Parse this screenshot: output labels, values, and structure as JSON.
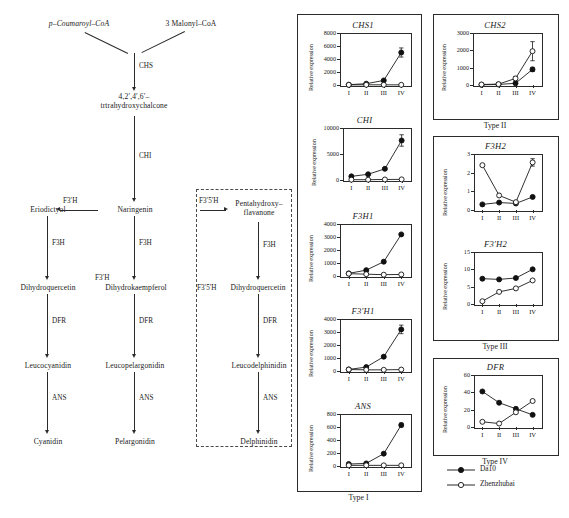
{
  "pathway": {
    "substrates": [
      {
        "id": "p-coumaroyl",
        "label": "p–Coumaroyl–CoA"
      },
      {
        "id": "malonyl",
        "label": "3  Malonyl–CoA"
      }
    ],
    "nodes": [
      {
        "id": "chalcone",
        "line1": "4,2′,4′,6′–",
        "line2": "trtrahydroxychalcone"
      },
      {
        "id": "eriodictyol",
        "line1": "Eriodictyol",
        "line2": ""
      },
      {
        "id": "naringenin",
        "line1": "Naringenin",
        "line2": ""
      },
      {
        "id": "pentahydroxy",
        "line1": "Pentahydroxy–",
        "line2": "flavanone"
      },
      {
        "id": "dihydroquercetin-left",
        "line1": "Dihydroquercetin",
        "line2": ""
      },
      {
        "id": "dihydrokaempferol",
        "line1": "Dihydrokaempferol",
        "line2": ""
      },
      {
        "id": "dihydroquercetin-right",
        "line1": "Dihydroquercetin",
        "line2": ""
      },
      {
        "id": "leucocyanidin",
        "line1": "Leucocyanidin",
        "line2": ""
      },
      {
        "id": "leucopelargonidin",
        "line1": "Leucopelargonidin",
        "line2": ""
      },
      {
        "id": "leucodelphinidin",
        "line1": "Leucodelphinidin",
        "line2": ""
      },
      {
        "id": "cyanidin",
        "line1": "Cyanidin",
        "line2": ""
      },
      {
        "id": "pelargonidin",
        "line1": "Pelargonidin",
        "line2": ""
      },
      {
        "id": "delphinidin",
        "line1": "Delphinidin",
        "line2": ""
      }
    ],
    "enzymes": {
      "chs": "CHS",
      "chi": "CHI",
      "f3ph_a": "F3′H",
      "f3p5ph_a": "F3′5′H",
      "f3h_left": "F3H",
      "f3h_mid": "F3H",
      "f3h_right": "F3H",
      "f3ph_b": "F3′H",
      "f3p5ph_b": "F3′5′H",
      "dfr_left": "DFR",
      "dfr_mid": "DFR",
      "dfr_right": "DFR",
      "ans_left": "ANS",
      "ans_mid": "ANS",
      "ans_right": "ANS"
    }
  },
  "axis": {
    "ylabel": "Relative expression",
    "xticks": [
      "I",
      "II",
      "III",
      "IV"
    ]
  },
  "legend": {
    "items": [
      {
        "name": "Da10",
        "marker": "filled-circle"
      },
      {
        "name": "Zhenzhubai",
        "marker": "open-circle"
      }
    ]
  },
  "groups": [
    {
      "id": "type1",
      "label": "Type I"
    },
    {
      "id": "type2",
      "label": "Type II"
    },
    {
      "id": "type3",
      "label": "Type III"
    },
    {
      "id": "type4",
      "label": "Type IV"
    }
  ],
  "chart_data": [
    {
      "id": "CHS1",
      "type": "line",
      "title": "CHS1",
      "group": "Type I",
      "xlabel": "",
      "ylabel": "Relative expression",
      "categories": [
        "I",
        "II",
        "III",
        "IV"
      ],
      "ylim": [
        0,
        8000
      ],
      "yticks": [
        0,
        2000,
        4000,
        6000,
        8000
      ],
      "grid": false,
      "legend_position": "external-bottom-right",
      "series": [
        {
          "name": "Da10",
          "marker": "filled-circle",
          "values": [
            50,
            200,
            700,
            5000
          ],
          "errors": [
            0,
            40,
            120,
            700
          ]
        },
        {
          "name": "Zhenzhubai",
          "marker": "open-circle",
          "values": [
            20,
            30,
            30,
            20
          ],
          "errors": [
            0,
            0,
            0,
            0
          ]
        }
      ]
    },
    {
      "id": "CHI",
      "type": "line",
      "title": "CHI",
      "group": "Type I",
      "xlabel": "",
      "ylabel": "Relative expression",
      "categories": [
        "I",
        "II",
        "III",
        "IV"
      ],
      "ylim": [
        0,
        10000
      ],
      "yticks": [
        0,
        5000,
        10000
      ],
      "grid": false,
      "series": [
        {
          "name": "Da10",
          "marker": "filled-circle",
          "values": [
            700,
            1100,
            2150,
            7600
          ],
          "errors": [
            130,
            150,
            200,
            1100
          ]
        },
        {
          "name": "Zhenzhubai",
          "marker": "open-circle",
          "values": [
            60,
            60,
            100,
            120
          ],
          "errors": [
            0,
            0,
            0,
            0
          ]
        }
      ]
    },
    {
      "id": "F3H1",
      "type": "line",
      "title": "F3H1",
      "group": "Type I",
      "xlabel": "",
      "ylabel": "Relative expression",
      "categories": [
        "I",
        "II",
        "III",
        "IV"
      ],
      "ylim": [
        0,
        4000
      ],
      "yticks": [
        0,
        1000,
        2000,
        3000,
        4000
      ],
      "grid": false,
      "series": [
        {
          "name": "Da10",
          "marker": "filled-circle",
          "values": [
            200,
            450,
            1100,
            3200
          ],
          "errors": [
            0,
            60,
            110,
            0
          ]
        },
        {
          "name": "Zhenzhubai",
          "marker": "open-circle",
          "values": [
            180,
            140,
            100,
            120
          ],
          "errors": [
            0,
            0,
            0,
            0
          ]
        }
      ]
    },
    {
      "id": "F3'H1",
      "type": "line",
      "title": "F3′H1",
      "group": "Type I",
      "xlabel": "",
      "ylabel": "Relative expression",
      "categories": [
        "I",
        "II",
        "III",
        "IV"
      ],
      "ylim": [
        0,
        4000
      ],
      "yticks": [
        0,
        1000,
        2000,
        3000,
        4000
      ],
      "grid": false,
      "series": [
        {
          "name": "Da10",
          "marker": "filled-circle",
          "values": [
            120,
            300,
            1100,
            3200
          ],
          "errors": [
            0,
            60,
            110,
            330
          ]
        },
        {
          "name": "Zhenzhubai",
          "marker": "open-circle",
          "values": [
            110,
            90,
            90,
            110
          ],
          "errors": [
            0,
            0,
            0,
            0
          ]
        }
      ]
    },
    {
      "id": "ANS",
      "type": "line",
      "title": "ANS",
      "group": "Type I",
      "xlabel": "",
      "ylabel": "Relative expression",
      "categories": [
        "I",
        "II",
        "III",
        "IV"
      ],
      "ylim": [
        0,
        800
      ],
      "yticks": [
        0,
        200,
        400,
        600,
        800
      ],
      "grid": false,
      "series": [
        {
          "name": "Da10",
          "marker": "filled-circle",
          "values": [
            30,
            40,
            190,
            630
          ],
          "errors": [
            0,
            0,
            20,
            30
          ]
        },
        {
          "name": "Zhenzhubai",
          "marker": "open-circle",
          "values": [
            10,
            10,
            10,
            10
          ],
          "errors": [
            0,
            0,
            0,
            0
          ]
        }
      ]
    },
    {
      "id": "CHS2",
      "type": "line",
      "title": "CHS2",
      "group": "Type II",
      "xlabel": "",
      "ylabel": "Relative expression",
      "categories": [
        "I",
        "II",
        "III",
        "IV"
      ],
      "ylim": [
        0,
        3000
      ],
      "yticks": [
        0,
        1000,
        2000,
        3000
      ],
      "grid": false,
      "series": [
        {
          "name": "Da10",
          "marker": "filled-circle",
          "values": [
            10,
            30,
            100,
            900
          ],
          "errors": [
            0,
            0,
            0,
            120
          ]
        },
        {
          "name": "Zhenzhubai",
          "marker": "open-circle",
          "values": [
            30,
            50,
            380,
            1950
          ],
          "errors": [
            0,
            60,
            110,
            550
          ]
        }
      ]
    },
    {
      "id": "F3H2",
      "type": "line",
      "title": "F3H2",
      "group": "Type III",
      "xlabel": "",
      "ylabel": "Relative expression",
      "categories": [
        "I",
        "II",
        "III",
        "IV"
      ],
      "ylim": [
        0,
        3
      ],
      "yticks": [
        0,
        1,
        2,
        3
      ],
      "grid": false,
      "series": [
        {
          "name": "Da10",
          "marker": "filled-circle",
          "values": [
            0.3,
            0.4,
            0.35,
            0.7
          ],
          "errors": [
            0,
            0,
            0,
            0
          ]
        },
        {
          "name": "Zhenzhubai",
          "marker": "open-circle",
          "values": [
            2.4,
            0.78,
            0.42,
            2.55
          ],
          "errors": [
            0,
            0,
            0,
            0.2
          ]
        }
      ]
    },
    {
      "id": "F3'H2",
      "type": "line",
      "title": "F3′H2",
      "group": "Type III",
      "xlabel": "",
      "ylabel": "Relative expression",
      "categories": [
        "I",
        "II",
        "III",
        "IV"
      ],
      "ylim": [
        0,
        15
      ],
      "yticks": [
        0,
        5,
        10,
        15
      ],
      "grid": false,
      "series": [
        {
          "name": "Da10",
          "marker": "filled-circle",
          "values": [
            7.3,
            7.1,
            7.5,
            10.0
          ],
          "errors": [
            0,
            0,
            0,
            0
          ]
        },
        {
          "name": "Zhenzhubai",
          "marker": "open-circle",
          "values": [
            0.8,
            3.5,
            4.5,
            6.8
          ],
          "errors": [
            0,
            0,
            0,
            0
          ]
        }
      ]
    },
    {
      "id": "DFR",
      "type": "line",
      "title": "DFR",
      "group": "Type IV",
      "xlabel": "",
      "ylabel": "Relative expression",
      "categories": [
        "I",
        "II",
        "III",
        "IV"
      ],
      "ylim": [
        0,
        60
      ],
      "yticks": [
        0,
        20,
        40,
        60
      ],
      "grid": false,
      "series": [
        {
          "name": "Da10",
          "marker": "filled-circle",
          "values": [
            41,
            28,
            21,
            14
          ],
          "errors": [
            0,
            0,
            0,
            0
          ]
        },
        {
          "name": "Zhenzhubai",
          "marker": "open-circle",
          "values": [
            6,
            4,
            17,
            30
          ],
          "errors": [
            0,
            0,
            0,
            0
          ]
        }
      ]
    }
  ],
  "caption": {
    "text": ""
  }
}
